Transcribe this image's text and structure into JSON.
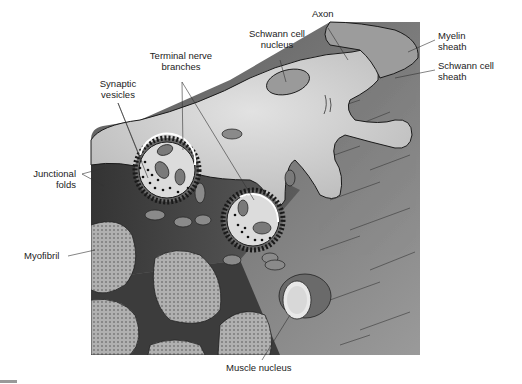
{
  "diagram": {
    "labels": {
      "axon": "Axon",
      "schwann_nucleus": "Schwann cell\nnucleus",
      "myelin_sheath": "Myelin\nsheath",
      "schwann_sheath": "Schwann cell\nsheath",
      "terminal_branches": "Terminal nerve\nbranches",
      "synaptic_vesicles": "Synaptic\nvesicles",
      "junctional_folds": "Junctional\nfolds",
      "myofibril": "Myofibril",
      "muscle_nucleus": "Muscle nucleus"
    },
    "colors": {
      "background": "#ffffff",
      "muscle_dark": "#3a3a3a",
      "muscle_mid": "#6e6e6e",
      "muscle_light": "#9a9a9a",
      "nerve": "#cfcfcf",
      "myofibril": "#a8a8a8",
      "outline": "#1a1a1a",
      "leader": "#333333"
    }
  }
}
